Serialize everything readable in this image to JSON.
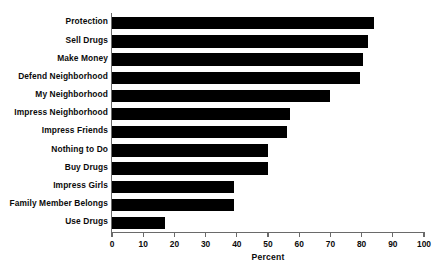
{
  "chart_data": {
    "type": "bar",
    "orientation": "horizontal",
    "title": "",
    "xlabel": "Percent",
    "ylabel": "",
    "xlim": [
      0,
      100
    ],
    "xticks": [
      0,
      10,
      20,
      30,
      40,
      50,
      60,
      70,
      80,
      90,
      100
    ],
    "grid": false,
    "legend": null,
    "bar_color": "#000000",
    "axis_color": "#6a6a6a",
    "background": "#ffffff",
    "categories": [
      "Protection",
      "Sell Drugs",
      "Make Money",
      "Defend Neighborhood",
      "My Neighborhood",
      "Impress Neighborhood",
      "Impress Friends",
      "Nothing to Do",
      "Buy Drugs",
      "Impress Girls",
      "Family Member  Belongs",
      "Use Drugs"
    ],
    "values": [
      84,
      82,
      80.5,
      79.5,
      70,
      57,
      56,
      50,
      50,
      39,
      39,
      17
    ]
  }
}
